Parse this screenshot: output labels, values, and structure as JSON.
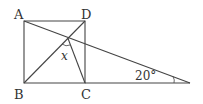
{
  "diagram": {
    "type": "geometry",
    "points": {
      "A": {
        "label": "A",
        "x": 24,
        "y": 21
      },
      "D": {
        "label": "D",
        "x": 85,
        "y": 21
      },
      "B": {
        "label": "B",
        "x": 24,
        "y": 83
      },
      "C": {
        "label": "C",
        "x": 85,
        "y": 83
      },
      "E": {
        "label": "",
        "x": 190,
        "y": 83
      },
      "P": {
        "label": "",
        "x": 68,
        "y": 38
      }
    },
    "angle_labels": {
      "x": "x",
      "twenty": "20°"
    },
    "stroke_color": "#444444"
  }
}
